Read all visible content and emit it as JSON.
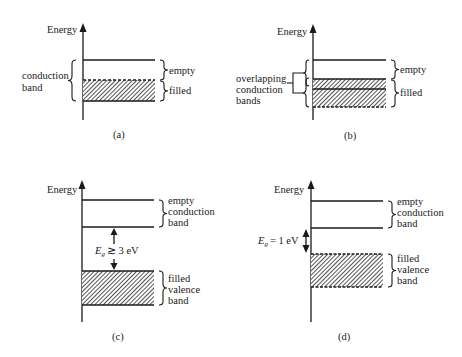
{
  "figure": {
    "axis_label": "Energy",
    "panels": [
      {
        "id": "a",
        "caption": "(a)",
        "left_label": [
          "conduction",
          "band"
        ],
        "right_labels": [
          {
            "text": [
              "empty"
            ]
          },
          {
            "text": [
              "filled"
            ]
          }
        ]
      },
      {
        "id": "b",
        "caption": "(b)",
        "left_label": [
          "overlapping",
          "conduction",
          "bands"
        ],
        "right_labels": [
          {
            "text": [
              "empty"
            ]
          },
          {
            "text": [
              "filled"
            ]
          }
        ]
      },
      {
        "id": "c",
        "caption": "(c)",
        "gap_label": {
          "symbol": "E",
          "subscript": "g",
          "relation": "≳ 3 eV"
        },
        "right_labels": [
          {
            "text": [
              "empty",
              "conduction",
              "band"
            ]
          },
          {
            "text": [
              "filled",
              "valence",
              "band"
            ]
          }
        ]
      },
      {
        "id": "d",
        "caption": "(d)",
        "gap_label": {
          "symbol": "E",
          "subscript": "g",
          "relation": "= 1 eV"
        },
        "right_labels": [
          {
            "text": [
              "empty",
              "conduction",
              "band"
            ]
          },
          {
            "text": [
              "filled",
              "valence",
              "band"
            ]
          }
        ]
      }
    ],
    "colors": {
      "ink": "#1a1a1a",
      "background": "#ffffff"
    }
  }
}
